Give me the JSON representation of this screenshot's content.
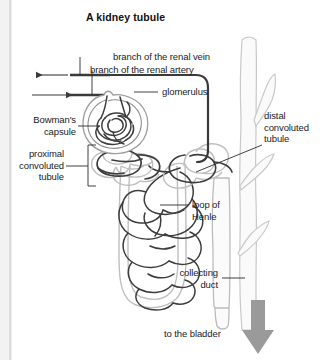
{
  "figure": {
    "title": "A kidney tubule",
    "type": "biological-diagram",
    "background_color": "#ffffff",
    "ink_color": "#2b2b2b",
    "tubule_color": "#b9b9b9",
    "vessel_color": "#d9d9d9",
    "arrow_color": "#9a9a9a"
  },
  "labels": {
    "renal_vein": "branch of the renal vein",
    "renal_artery": "branch of the renal artery",
    "glomerulus": "glomerulus",
    "bowmans_capsule": "Bowman's\ncapsule",
    "proximal_convoluted_tubule": "proximal\nconvoluted\ntubule",
    "distal_convoluted_tubule": "distal\nconvoluted\ntubule",
    "loop_of_henle": "loop of\nHenle",
    "collecting_duct": "collecting\nduct",
    "to_the_bladder": "to the bladder"
  },
  "flow_arrows": [
    {
      "name": "renal-vein-outflow",
      "direction": "left",
      "x": 38,
      "y": 75
    },
    {
      "name": "renal-artery-inflow",
      "direction": "right",
      "x": 38,
      "y": 95
    },
    {
      "name": "urine-to-bladder",
      "direction": "down",
      "x": 258,
      "y": 300
    }
  ]
}
